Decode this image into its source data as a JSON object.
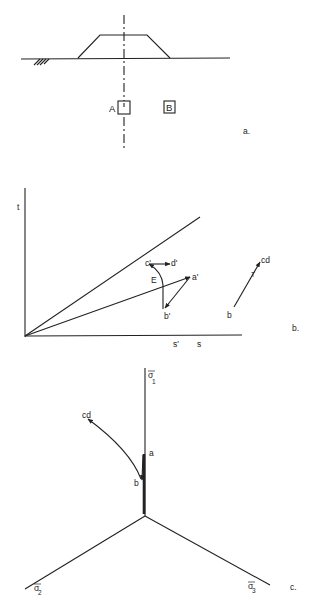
{
  "panel_a": {
    "caption": "a.",
    "element_a_label": "A",
    "element_b_label": "B",
    "description": "Embankment on ground surface with centerline; soil elements A (under centerline) and B (offset)"
  },
  "panel_b": {
    "caption": "b.",
    "y_axis_label": "t",
    "x_axis_labels": [
      "s'",
      "s"
    ],
    "effective_path_points": [
      "a'",
      "b'",
      "c'",
      "d'"
    ],
    "curve_label": "E",
    "total_path_points": [
      "b",
      "cd"
    ],
    "total_path_marker": "T"
  },
  "panel_c": {
    "caption": "c.",
    "axis_1": {
      "symbol": "σ",
      "sub": "1"
    },
    "axis_2": {
      "symbol": "σ",
      "sub": "2"
    },
    "axis_3": {
      "symbol": "σ",
      "sub": "3"
    },
    "path_points": [
      "a",
      "b",
      "cd"
    ]
  }
}
